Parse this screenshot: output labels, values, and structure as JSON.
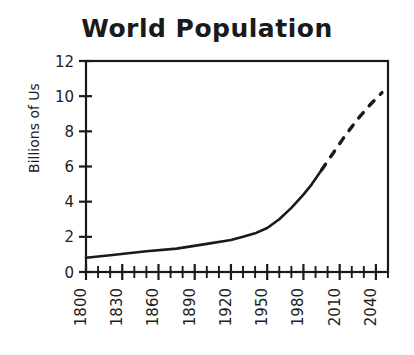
{
  "chart_data": {
    "type": "line",
    "title": "World Population",
    "xlabel": "",
    "ylabel": "Billions of Us",
    "xlim": [
      1800,
      2050
    ],
    "ylim": [
      0,
      12
    ],
    "grid": false,
    "legend": null,
    "y_ticks": [
      0,
      2,
      4,
      6,
      8,
      10,
      12
    ],
    "y_tick_labels": [
      "0",
      "2",
      "4",
      "6",
      "8",
      "10",
      "12"
    ],
    "y_minor_tick_step": 2,
    "x_ticks": [
      1800,
      1830,
      1860,
      1890,
      1920,
      1950,
      1980,
      2010,
      2040
    ],
    "x_tick_labels": [
      "1800",
      "1830",
      "1860",
      "1890",
      "1920",
      "1950",
      "1980",
      "2010",
      "2040"
    ],
    "x_minor_tick_step": 10,
    "x_tick_label_rotation": -90,
    "line_color": "#1a1a1a",
    "line_width": 2.6,
    "series": [
      {
        "name": "Historical population",
        "style": "solid",
        "x": [
          1800,
          1820,
          1850,
          1875,
          1900,
          1920,
          1930,
          1940,
          1950,
          1960,
          1970,
          1980,
          1987,
          1995
        ],
        "values": [
          0.81,
          0.95,
          1.18,
          1.33,
          1.6,
          1.82,
          2.0,
          2.2,
          2.5,
          3.0,
          3.65,
          4.4,
          5.0,
          5.8
        ]
      },
      {
        "name": "Projected population",
        "style": "dashed",
        "x": [
          1995,
          2005,
          2015,
          2025,
          2035,
          2045
        ],
        "values": [
          5.8,
          6.8,
          7.8,
          8.7,
          9.5,
          10.2
        ]
      }
    ]
  }
}
